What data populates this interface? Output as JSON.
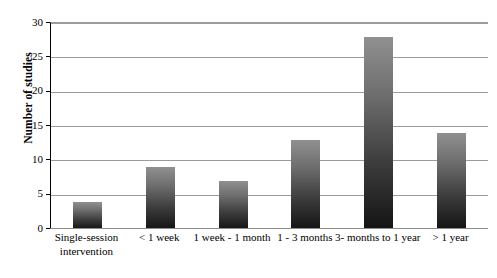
{
  "chart_data": {
    "type": "bar",
    "title": "",
    "xlabel": "",
    "ylabel": "Number of studies",
    "categories": [
      "Single-session intervention",
      "< 1 week",
      "1 week - 1 month",
      "1 - 3 months",
      "3- months to 1 year",
      "> 1 year"
    ],
    "values": [
      4,
      9,
      7,
      13,
      28,
      14
    ],
    "ylim": [
      0,
      30
    ],
    "yticks": [
      0,
      5,
      10,
      15,
      20,
      25,
      30
    ],
    "ytick_labels": [
      "0",
      "5",
      "10",
      "15",
      "20",
      "25",
      "30"
    ],
    "grid": true,
    "legend": "none",
    "bar_fill": "#4a4a4a",
    "gridline_color": "#9b9b9b",
    "axis_color": "#000000",
    "background": "#ffffff"
  }
}
